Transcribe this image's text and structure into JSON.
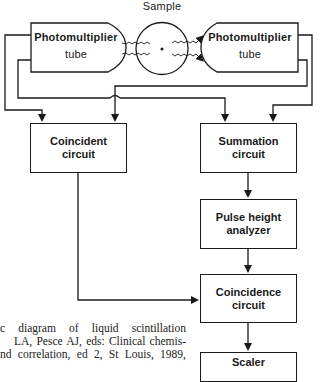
{
  "diagram": {
    "title": "Sample",
    "nodes": {
      "pmt_left": {
        "line1": "Photomultiplier",
        "line2": "tube"
      },
      "pmt_right": {
        "line1": "Photomultiplier",
        "line2": "tube"
      },
      "coincident": {
        "line1": "Coincident",
        "line2": "circuit"
      },
      "summation": {
        "line1": "Summation",
        "line2": "circuit"
      },
      "pulse_height": {
        "line1": "Pulse height",
        "line2": "analyzer"
      },
      "coincidence": {
        "line1": "Coincidence",
        "line2": "circuit"
      },
      "scaler": {
        "line1": "Scaler"
      }
    },
    "edges": [
      {
        "from": "pmt_left",
        "to": "coincident"
      },
      {
        "from": "pmt_left",
        "to": "summation"
      },
      {
        "from": "pmt_right",
        "to": "coincident"
      },
      {
        "from": "pmt_right",
        "to": "summation"
      },
      {
        "from": "summation",
        "to": "pulse_height"
      },
      {
        "from": "pulse_height",
        "to": "coincidence"
      },
      {
        "from": "coincident",
        "to": "coincidence"
      },
      {
        "from": "coincidence",
        "to": "scaler"
      }
    ]
  },
  "caption": {
    "line1": "c diagram of liquid scintillation",
    "line2": "LA, Pesce AJ, eds: Clinical chemis-",
    "line3": "nd correlation, ed 2, St Louis, 1989,"
  }
}
